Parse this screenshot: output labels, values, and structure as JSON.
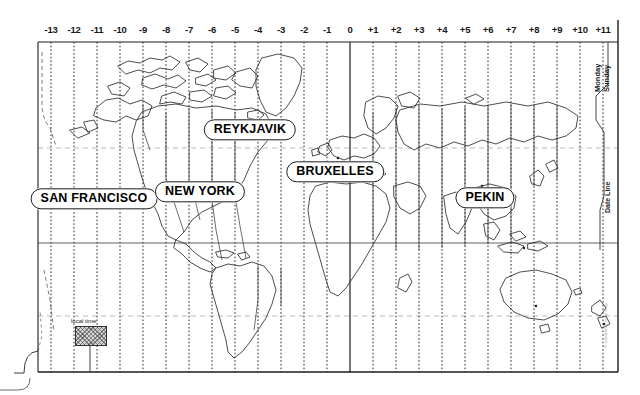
{
  "map": {
    "title": "World Time Zone Map",
    "background_color": "#ffffff",
    "line_color": "#1b1d1f",
    "frame": {
      "left": 38,
      "top": 42,
      "right": 618,
      "bottom": 372
    }
  },
  "timezone_axis": {
    "label": "UTC offset hours",
    "ticks": [
      {
        "label": "-13",
        "x": 51
      },
      {
        "label": "-12",
        "x": 74
      },
      {
        "label": "-11",
        "x": 97
      },
      {
        "label": "-10",
        "x": 120
      },
      {
        "label": "-9",
        "x": 143
      },
      {
        "label": "-8",
        "x": 166
      },
      {
        "label": "-7",
        "x": 189
      },
      {
        "label": "-6",
        "x": 212
      },
      {
        "label": "-5",
        "x": 235
      },
      {
        "label": "-4",
        "x": 258
      },
      {
        "label": "-3",
        "x": 281
      },
      {
        "label": "-2",
        "x": 304
      },
      {
        "label": "-1",
        "x": 327
      },
      {
        "label": "0",
        "x": 350
      },
      {
        "label": "+1",
        "x": 373
      },
      {
        "label": "+2",
        "x": 396
      },
      {
        "label": "+3",
        "x": 419
      },
      {
        "label": "+4",
        "x": 442
      },
      {
        "label": "+5",
        "x": 465
      },
      {
        "label": "+6",
        "x": 488
      },
      {
        "label": "+7",
        "x": 511
      },
      {
        "label": "+8",
        "x": 534
      },
      {
        "label": "+9",
        "x": 557
      },
      {
        "label": "+10",
        "x": 580
      },
      {
        "label": "+11",
        "x": 603
      }
    ]
  },
  "cities": [
    {
      "name": "SAN FRANCISCO",
      "x": 94,
      "y": 199
    },
    {
      "name": "NEW YORK",
      "x": 200,
      "y": 192
    },
    {
      "name": "REYKJAVIK",
      "x": 250,
      "y": 130
    },
    {
      "name": "BRUXELLES",
      "x": 335,
      "y": 172
    },
    {
      "name": "PEKIN",
      "x": 485,
      "y": 198
    }
  ],
  "date_line": {
    "left_day": "Monday",
    "right_day": "Sunday",
    "label": "Date Line"
  },
  "legend": {
    "caption": "local time",
    "swatch_fill": "#d7d7d7",
    "swatch_x": 75,
    "swatch_y": 326,
    "swatch_w": 30,
    "swatch_h": 18
  },
  "credit": {
    "text": "© world time zone map"
  }
}
